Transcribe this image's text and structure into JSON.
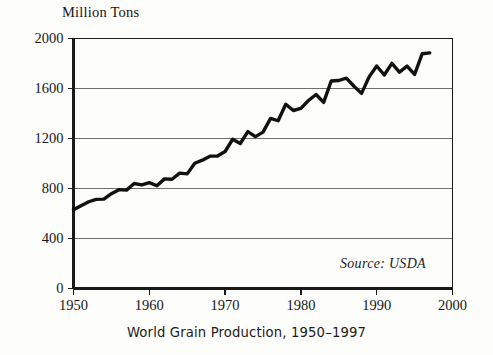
{
  "figure": {
    "unit_label": "Million Tons",
    "source_note": "Source: USDA",
    "caption": "World Grain Production, 1950–1997",
    "line_color": "#111111",
    "axis_color": "#1a1a1a",
    "grid_color": "#6f6f6f",
    "background_color": "#fdfdfb"
  },
  "chart_data": {
    "type": "line",
    "title": "World Grain Production, 1950–1997",
    "xlabel": "",
    "ylabel": "Million Tons",
    "xlim": [
      1950,
      2000
    ],
    "ylim": [
      0,
      2000
    ],
    "xticks": [
      1950,
      1960,
      1970,
      1980,
      1990,
      2000
    ],
    "yticks": [
      0,
      400,
      800,
      1200,
      1600,
      2000
    ],
    "grid": "horizontal",
    "legend": "none",
    "series": [
      {
        "name": "World Grain Production",
        "x": [
          1950,
          1951,
          1952,
          1953,
          1954,
          1955,
          1956,
          1957,
          1958,
          1959,
          1960,
          1961,
          1962,
          1963,
          1964,
          1965,
          1966,
          1967,
          1968,
          1969,
          1970,
          1971,
          1972,
          1973,
          1974,
          1975,
          1976,
          1977,
          1978,
          1979,
          1980,
          1981,
          1982,
          1983,
          1984,
          1985,
          1986,
          1987,
          1988,
          1989,
          1990,
          1991,
          1992,
          1993,
          1994,
          1995,
          1996,
          1997
        ],
        "values": [
          631,
          662,
          694,
          713,
          715,
          759,
          791,
          787,
          840,
          829,
          847,
          822,
          877,
          874,
          923,
          917,
          1002,
          1027,
          1059,
          1060,
          1096,
          1194,
          1160,
          1255,
          1215,
          1251,
          1361,
          1342,
          1474,
          1424,
          1441,
          1504,
          1552,
          1489,
          1660,
          1664,
          1683,
          1618,
          1561,
          1693,
          1780,
          1708,
          1801,
          1731,
          1779,
          1713,
          1878,
          1885
        ]
      }
    ]
  }
}
